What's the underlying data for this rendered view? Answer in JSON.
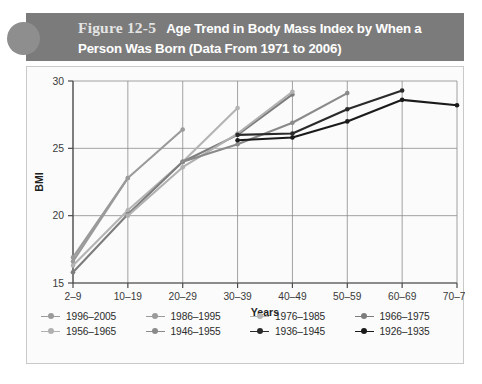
{
  "header": {
    "figure_number": "Figure 12-5",
    "title": "Age Trend in Body Mass Index by When a Person Was Born (Data From 1971 to 2006)",
    "badge_icon": "circle-badge",
    "bar_color": "#7b7b7b",
    "badge_color": "#8e8e8e"
  },
  "chart_data": {
    "type": "line",
    "title": "Age Trend in Body Mass Index by When a Person Was Born (Data From 1971 to 2006)",
    "xlabel": "Years",
    "ylabel": "BMI",
    "categories": [
      "2–9",
      "10–19",
      "20–29",
      "30–39",
      "40–49",
      "50–59",
      "60–69",
      "70–79"
    ],
    "ylim": [
      15,
      30
    ],
    "yticks": [
      15,
      20,
      25,
      30
    ],
    "grid": true,
    "legend_position": "bottom",
    "series": [
      {
        "name": "1996–2005",
        "color": "#9a9a9a",
        "x": [
          "2–9",
          "10–19"
        ],
        "values": [
          16.9,
          22.8
        ]
      },
      {
        "name": "1986–1995",
        "color": "#9a9a9a",
        "x": [
          "2–9",
          "10–19",
          "20–29"
        ],
        "values": [
          16.6,
          22.8,
          26.4
        ]
      },
      {
        "name": "1976–1985",
        "color": "#b4b4b4",
        "x": [
          "2–9",
          "10–19",
          "20–29",
          "30–39"
        ],
        "values": [
          16.3,
          20.4,
          24.0,
          28.0
        ]
      },
      {
        "name": "1966–1975",
        "color": "#7d7d7d",
        "x": [
          "2–9",
          "10–19",
          "20–29",
          "30–39",
          "40–49"
        ],
        "values": [
          15.8,
          20.1,
          24.0,
          26.0,
          29.0
        ]
      },
      {
        "name": "1956–1965",
        "color": "#b0b0b0",
        "x": [
          "10–19",
          "20–29",
          "30–39",
          "40–49"
        ],
        "values": [
          20.0,
          23.6,
          26.1,
          29.2
        ]
      },
      {
        "name": "1946–1955",
        "color": "#8a8a8a",
        "x": [
          "20–29",
          "30–39",
          "40–49",
          "50–59"
        ],
        "values": [
          24.0,
          25.3,
          26.9,
          29.1
        ]
      },
      {
        "name": "1936–1945",
        "color": "#2a2a2a",
        "x": [
          "30–39",
          "40–49",
          "50–59",
          "60–69"
        ],
        "values": [
          26.0,
          26.1,
          27.9,
          29.3
        ]
      },
      {
        "name": "1926–1935",
        "color": "#1a1a1a",
        "x": [
          "30–39",
          "40–49",
          "50–59",
          "60–69",
          "70–79"
        ],
        "values": [
          25.6,
          25.8,
          27.0,
          28.6,
          28.2
        ]
      }
    ]
  },
  "axes": {
    "y_tick_labels": [
      "30",
      "25",
      "20",
      "15"
    ],
    "x_tick_labels": [
      "2–9",
      "10–19",
      "20–29",
      "30–39",
      "40–49",
      "50–59",
      "60–69",
      "70–79"
    ],
    "y_axis_title": "BMI",
    "x_axis_title": "Years"
  }
}
